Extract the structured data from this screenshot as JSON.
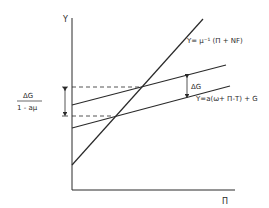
{
  "diagram": {
    "axes": {
      "y_label": "Y",
      "x_label": "Π"
    },
    "curves": [
      {
        "id": "income-line",
        "label": "Y= μ⁻¹ (Π + NF)"
      },
      {
        "id": "upper-spending-line",
        "label": ""
      },
      {
        "id": "lower-spending-line",
        "label": "Y=a(ω+ Π-T) + G"
      }
    ],
    "annotations": {
      "delta_g": "ΔG",
      "multiplier_numerator": "ΔG",
      "multiplier_denominator": "1 - aμ"
    },
    "colors": {
      "line": "#2a2a2a",
      "background": "#ffffff"
    }
  }
}
